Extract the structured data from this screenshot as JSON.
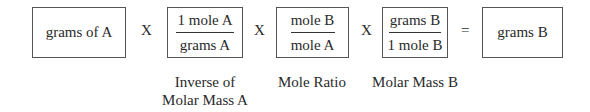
{
  "diagram": {
    "start": {
      "text": "grams of A"
    },
    "factors": [
      {
        "numerator": "1 mole A",
        "denominator": "grams A",
        "label_line1": "Inverse of",
        "label_line2": "Molar Mass A"
      },
      {
        "numerator": "mole B",
        "denominator": "mole A",
        "label_line1": "Mole Ratio",
        "label_line2": ""
      },
      {
        "numerator": "grams B",
        "denominator": "1 mole B",
        "label_line1": "Molar Mass B",
        "label_line2": ""
      }
    ],
    "operators": {
      "multiply": "X",
      "equals": "="
    },
    "result": {
      "text": "grams B"
    }
  }
}
